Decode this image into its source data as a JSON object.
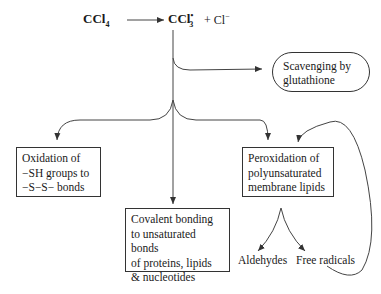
{
  "diagram": {
    "reactant": {
      "base": "CCl",
      "sub": "4"
    },
    "product_radical": {
      "base": "CCl",
      "sup": "•",
      "sub": "3"
    },
    "product_ion": {
      "plus": "+",
      "base": "Cl",
      "sup": "−"
    },
    "nodes": {
      "scavenging": {
        "line1": "Scavenging by",
        "line2": "glutathione"
      },
      "oxidation": {
        "line1": "Oxidation of",
        "line2": "−SH groups to",
        "line3": "−S−S− bonds"
      },
      "covalent": {
        "line1": "Covalent bonding",
        "line2": "to unsaturated bonds",
        "line3": "of proteins, lipids",
        "line4": "& nucleotides"
      },
      "peroxidation": {
        "line1": "Peroxidation of",
        "line2": "polyunsaturated",
        "line3": "membrane lipids"
      },
      "aldehydes": "Aldehydes",
      "free_radicals": "Free radicals"
    },
    "edges": [
      {
        "from": "CCl4",
        "to": "CCl3•"
      },
      {
        "from": "CCl3•",
        "to": "scavenging"
      },
      {
        "from": "CCl3•",
        "to": "oxidation"
      },
      {
        "from": "CCl3•",
        "to": "covalent"
      },
      {
        "from": "CCl3•",
        "to": "peroxidation"
      },
      {
        "from": "peroxidation",
        "to": "aldehydes"
      },
      {
        "from": "peroxidation",
        "to": "free_radicals"
      },
      {
        "from": "free_radicals",
        "to": "peroxidation",
        "style": "feedback loop"
      }
    ],
    "colors": {
      "line": "#333333",
      "text": "#1a1a1a",
      "background": "#ffffff"
    }
  }
}
